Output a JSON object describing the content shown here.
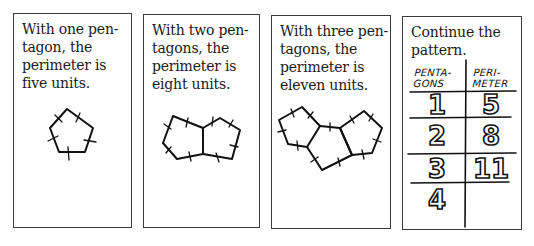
{
  "panels": [
    {
      "caption": "With one pen-\ntagon, the\nperimeter is\nfive units.",
      "pentagons": 1,
      "perimeter": 5
    },
    {
      "caption": "With two pen-\ntagons, the\nperimeter is\neight units.",
      "pentagons": 2,
      "perimeter": 8
    },
    {
      "caption": "With three pen-\ntagons, the\nperimeter is\neleven units.",
      "pentagons": 3,
      "perimeter": 11
    },
    {
      "caption": "Continue the\npattern."
    }
  ],
  "table": {
    "headers": [
      "PENTA-\nGONS",
      "PERI-\nMETER"
    ],
    "rows": [
      {
        "pentagons": "1",
        "perimeter": "5"
      },
      {
        "pentagons": "2",
        "perimeter": "8"
      },
      {
        "pentagons": "3",
        "perimeter": "11"
      },
      {
        "pentagons": "4",
        "perimeter": ""
      }
    ]
  },
  "colors": {
    "ink": "#111111",
    "border": "#3a3a3a",
    "background": "#ffffff"
  }
}
